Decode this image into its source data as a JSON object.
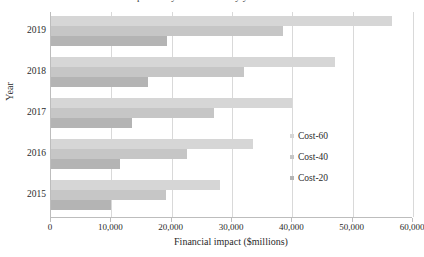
{
  "chart_data": {
    "type": "bar",
    "orientation": "horizontal",
    "title": "Financial impact of cyber incidents by year and cost scenario",
    "xlabel": "Financial impact ($millions)",
    "ylabel": "Year",
    "categories": [
      "2019",
      "2018",
      "2017",
      "2016",
      "2015"
    ],
    "xlim": [
      0,
      60000
    ],
    "xticks": [
      0,
      10000,
      20000,
      30000,
      40000,
      50000,
      60000
    ],
    "xticklabels": [
      "0",
      "10,000",
      "20,000",
      "30,000",
      "40,000",
      "50,000",
      "60,000"
    ],
    "grid": "vertical",
    "legend_position": "right",
    "series": [
      {
        "name": "Cost-60",
        "color": "#d6d6d6",
        "values": [
          56500,
          47000,
          40000,
          33500,
          28000
        ]
      },
      {
        "name": "Cost-40",
        "color": "#c6c6c6",
        "values": [
          38500,
          32000,
          27000,
          22500,
          19000
        ]
      },
      {
        "name": "Cost-20",
        "color": "#b4b4b4",
        "values": [
          19200,
          16000,
          13500,
          11500,
          10000
        ]
      }
    ]
  }
}
